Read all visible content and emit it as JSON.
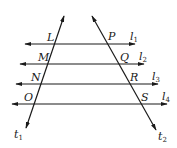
{
  "diagram": {
    "type": "parallel-lines-with-transversals",
    "parallel_lines": [
      {
        "name": "l",
        "sub": "1",
        "y": 44,
        "x1": 25,
        "x2": 135,
        "label_x": 130,
        "label_y": 40
      },
      {
        "name": "l",
        "sub": "2",
        "y": 64,
        "x1": 20,
        "x2": 144,
        "label_x": 139,
        "label_y": 60
      },
      {
        "name": "l",
        "sub": "3",
        "y": 84,
        "x1": 16,
        "x2": 158,
        "label_x": 152,
        "label_y": 80
      },
      {
        "name": "l",
        "sub": "4",
        "y": 104,
        "x1": 12,
        "x2": 167,
        "label_x": 162,
        "label_y": 100
      }
    ],
    "transversals": [
      {
        "name": "t",
        "sub": "1",
        "x1": 64,
        "y1": 16,
        "x2": 26,
        "y2": 128,
        "label_x": 14,
        "label_y": 138
      },
      {
        "name": "t",
        "sub": "2",
        "x1": 92,
        "y1": 16,
        "x2": 156,
        "y2": 130,
        "label_x": 158,
        "label_y": 140
      }
    ],
    "points": [
      {
        "label": "L",
        "x": 47,
        "y": 41
      },
      {
        "label": "M",
        "x": 38,
        "y": 61
      },
      {
        "label": "N",
        "x": 31,
        "y": 81
      },
      {
        "label": "O",
        "x": 24,
        "y": 101
      },
      {
        "label": "P",
        "x": 108,
        "y": 40
      },
      {
        "label": "Q",
        "x": 120,
        "y": 61
      },
      {
        "label": "R",
        "x": 130,
        "y": 81
      },
      {
        "label": "S",
        "x": 141,
        "y": 101
      }
    ],
    "stroke_color": "#1a1a1a"
  }
}
